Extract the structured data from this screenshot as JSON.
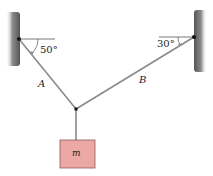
{
  "diagram": {
    "angles": {
      "left": "50°",
      "right": "30°"
    },
    "cables": {
      "left": "A",
      "right": "B"
    },
    "mass": {
      "label": "m"
    },
    "colors": {
      "wall": "#6f6f6f",
      "cable": "#8a8a8a",
      "box_fill": "#eba8a4",
      "box_border": "#8a5a58",
      "text": "#222222"
    }
  }
}
